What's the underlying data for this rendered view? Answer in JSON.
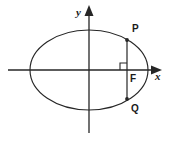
{
  "figure": {
    "background_color": "#ffffff",
    "ink_color": "#262626",
    "text_color": "#1a1a1a",
    "width": 170,
    "height": 141
  },
  "axes": {
    "x_axis": {
      "label": "x",
      "label_x": 155,
      "label_y": 80,
      "line": {
        "x1": 8,
        "y1": 70,
        "x2": 155,
        "y2": 70
      },
      "arrow": "right-arrow"
    },
    "y_axis": {
      "label": "y",
      "label_x": 76,
      "label_y": 16,
      "line": {
        "x1": 89,
        "y1": 133,
        "x2": 89,
        "y2": 12
      },
      "arrow": "up-arrow"
    },
    "origin": {
      "x": 89,
      "y": 70
    }
  },
  "ellipse": {
    "center_x": 89,
    "center_y": 70,
    "semi_major_a": 59,
    "semi_minor_b": 40
  },
  "chord": {
    "name": "latus-rectum",
    "x": 127,
    "y_top": 40,
    "y_bottom": 99
  },
  "points": [
    {
      "id": "P",
      "label": "P",
      "x": 127,
      "y": 40,
      "label_x": 132,
      "label_y": 32
    },
    {
      "id": "F",
      "label": "F",
      "x": 127,
      "y": 70,
      "label_x": 130,
      "label_y": 82
    },
    {
      "id": "Q",
      "label": "Q",
      "x": 127,
      "y": 99,
      "label_x": 131,
      "label_y": 112
    }
  ],
  "right_angle_marker": {
    "name": "right-angle-at-F",
    "x": 120,
    "y": 63,
    "size": 7
  }
}
